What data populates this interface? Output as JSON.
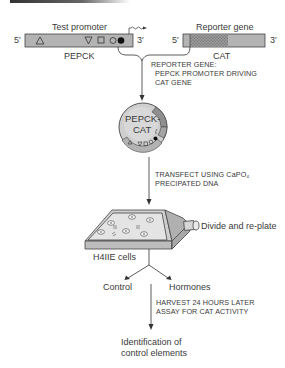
{
  "test_promoter": {
    "label": "Test promoter",
    "gene_name": "PEPCK",
    "end5": "5′",
    "end3": "3′",
    "elements": [
      "triangle",
      "inverted-triangle",
      "square",
      "open-circle",
      "filled-circle"
    ]
  },
  "reporter_gene": {
    "label": "Reporter gene",
    "gene_name": "CAT",
    "end5": "5′",
    "end3": "3′"
  },
  "step1": {
    "caption_line1": "REPORTER GENE:",
    "caption_line2": "PEPCK PROMOTER DRIVING",
    "caption_line3": "CAT GENE"
  },
  "plasmid": {
    "line1": "PEPCK-",
    "line2": "CAT"
  },
  "step2": {
    "caption_line1": "TRANSFECT USING CaPO₄",
    "caption_line2": "PRECIPATED DNA"
  },
  "dish": {
    "cells_label": "H4IIE cells",
    "side_label": "Divide and re-plate"
  },
  "branches": {
    "left": "Control",
    "right": "Hormones"
  },
  "step3": {
    "caption_line1": "HARVEST 24 HOURS LATER",
    "caption_line2": "ASSAY FOR CAT ACTIVITY"
  },
  "result": {
    "line1": "Identification of",
    "line2": "control elements"
  },
  "colors": {
    "bar_fill": "#b3b3b3",
    "cat_stipple": "#8a8a8a",
    "plasmid_fill": "#cfcfcf",
    "line": "#333333"
  }
}
